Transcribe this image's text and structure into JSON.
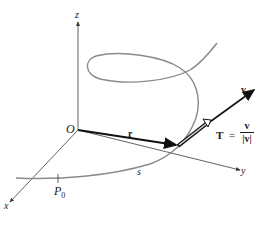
{
  "figure": {
    "type": "space-curve-unit-tangent",
    "axes": {
      "x_label": "x",
      "y_label": "y",
      "z_label": "z",
      "origin_label": "O"
    },
    "points": {
      "start_label": "P",
      "start_subscript": "0"
    },
    "vectors": {
      "position_label": "r",
      "velocity_label": "v",
      "tangent_label": "T",
      "equals": "=",
      "tangent_numerator": "v",
      "tangent_denominator": "|v|"
    },
    "arc_length_label": "s",
    "colors": {
      "curve": "#8a8a8a",
      "axes": "#3a3a3a",
      "vectors": "#111111",
      "background": "#ffffff"
    }
  }
}
